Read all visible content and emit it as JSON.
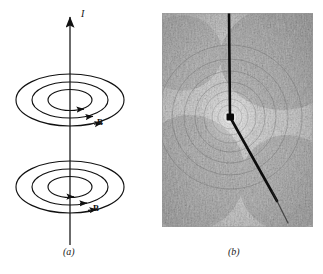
{
  "figure": {
    "type": "physics-illustration",
    "panels": [
      {
        "id": "a",
        "caption": "(a)",
        "kind": "line-diagram",
        "labels": [
          {
            "name": "current-label",
            "text": "I",
            "style": "italic",
            "meaning": "current direction, upward along wire"
          },
          {
            "name": "b-field-label-upper",
            "text": "B",
            "style": "bold",
            "meaning": "magnetic field vector"
          },
          {
            "name": "b-field-label-lower",
            "text": "B",
            "style": "bold",
            "meaning": "magnetic field vector"
          }
        ],
        "elements": {
          "wire_axis": "vertical arrow pointing up",
          "field_loop_groups": 2,
          "loops_per_group": 3,
          "loop_arrow_direction": "clockwise viewed from above"
        }
      },
      {
        "id": "b",
        "caption": "(b)",
        "kind": "photograph",
        "subject": "iron filings aligned in circles around a current-carrying wire",
        "wire": {
          "upper_segment": "vertical, from top edge to node",
          "node": "dark junction point near center",
          "lower_segment": "angled down and to the right"
        }
      }
    ],
    "colors": {
      "ink": "#111111",
      "background": "#ffffff",
      "photo_base": "#c9c9c9",
      "photo_dark": "#4a4a4a",
      "wire": "#0d0d0d"
    }
  }
}
